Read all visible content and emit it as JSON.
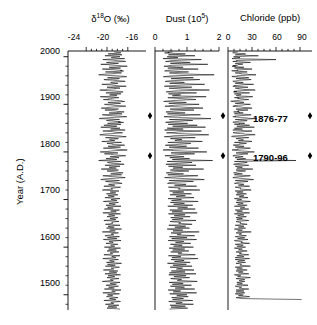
{
  "figure": {
    "yaxis": {
      "label": "Year (A.D.)",
      "ticks": [
        2000,
        1900,
        1800,
        1700,
        1600,
        1500
      ],
      "tick_labels": [
        "2000",
        "1900",
        "1800",
        "1700",
        "1600",
        "1500"
      ],
      "range": [
        1468,
        2012
      ],
      "minor_tick_interval": 20
    },
    "annotations": [
      {
        "name": "event-1876",
        "label": "1876-77",
        "year": 1876
      },
      {
        "name": "event-1790",
        "label": "1790-96",
        "year": 1792
      }
    ],
    "marker_color": "#000000",
    "line_color": "#000000"
  },
  "chart_data": [
    {
      "type": "line",
      "name": "d18o",
      "title": "δ",
      "title_sup": "18",
      "title_rest": "O (‰)",
      "title_plain": "δ18O (‰)",
      "xlabel": "δ18O (‰)",
      "ylabel": "Year (A.D.)",
      "xlim": [
        -27.5,
        -12.5
      ],
      "xticks": [
        -24,
        -20,
        -16
      ],
      "xtick_labels": [
        "-24",
        "-20",
        "-16"
      ],
      "ylim": [
        1468,
        2012
      ],
      "grid": false,
      "orientation": "vertical-time",
      "x": [
        2010,
        2008,
        2006,
        2004,
        2002,
        2000,
        1998,
        1996,
        1994,
        1992,
        1990,
        1988,
        1986,
        1984,
        1982,
        1980,
        1978,
        1976,
        1974,
        1972,
        1970,
        1968,
        1966,
        1964,
        1962,
        1960,
        1958,
        1956,
        1954,
        1952,
        1950,
        1948,
        1946,
        1944,
        1942,
        1940,
        1938,
        1936,
        1934,
        1932,
        1930,
        1928,
        1926,
        1924,
        1922,
        1920,
        1918,
        1916,
        1914,
        1912,
        1910,
        1908,
        1906,
        1904,
        1902,
        1900,
        1898,
        1896,
        1894,
        1892,
        1890,
        1888,
        1886,
        1884,
        1882,
        1880,
        1878,
        1876,
        1874,
        1872,
        1870,
        1868,
        1866,
        1864,
        1862,
        1860,
        1858,
        1856,
        1854,
        1852,
        1850,
        1848,
        1846,
        1844,
        1842,
        1840,
        1838,
        1836,
        1834,
        1832,
        1830,
        1828,
        1826,
        1824,
        1822,
        1820,
        1818,
        1816,
        1814,
        1812,
        1810,
        1808,
        1806,
        1804,
        1802,
        1800,
        1798,
        1796,
        1794,
        1792,
        1790,
        1788,
        1786,
        1784,
        1782,
        1780,
        1778,
        1776,
        1774,
        1772,
        1770,
        1768,
        1766,
        1764,
        1762,
        1760,
        1758,
        1756,
        1754,
        1752,
        1750,
        1748,
        1746,
        1744,
        1742,
        1740,
        1738,
        1736,
        1734,
        1732,
        1730,
        1728,
        1726,
        1724,
        1722,
        1720,
        1718,
        1716,
        1714,
        1712,
        1710,
        1708,
        1706,
        1704,
        1702,
        1700,
        1698,
        1696,
        1694,
        1692,
        1690,
        1688,
        1686,
        1684,
        1682,
        1680,
        1678,
        1676,
        1674,
        1672,
        1670,
        1668,
        1666,
        1664,
        1662,
        1660,
        1658,
        1656,
        1654,
        1652,
        1650,
        1648,
        1646,
        1644,
        1642,
        1640,
        1638,
        1636,
        1634,
        1632,
        1630,
        1628,
        1626,
        1624,
        1622,
        1620,
        1618,
        1616,
        1614,
        1612,
        1610,
        1608,
        1606,
        1604,
        1602,
        1600,
        1598,
        1596,
        1594,
        1592,
        1590,
        1588,
        1586,
        1584,
        1582,
        1580,
        1578,
        1576,
        1574,
        1572,
        1570,
        1568,
        1566,
        1564,
        1562,
        1560,
        1558,
        1556,
        1554,
        1552,
        1550,
        1548,
        1546,
        1544,
        1542,
        1540,
        1538,
        1536,
        1534,
        1532,
        1530,
        1528,
        1526,
        1524,
        1522,
        1520,
        1518,
        1516,
        1514,
        1512,
        1510,
        1508,
        1506,
        1504,
        1502,
        1500,
        1498,
        1496,
        1494,
        1492,
        1490,
        1488,
        1486,
        1484,
        1482,
        1480,
        1478,
        1476,
        1474,
        1472,
        1470
      ],
      "values": [
        -18.6,
        -17.3,
        -19.8,
        -17.1,
        -20.4,
        -17.5,
        -19.2,
        -16.6,
        -20.8,
        -18.2,
        -16.4,
        -20.1,
        -17.8,
        -21.2,
        -18.4,
        -16.1,
        -19.6,
        -17.4,
        -20.9,
        -18.1,
        -16.8,
        -20.3,
        -17.2,
        -19.4,
        -21.6,
        -18.3,
        -16.2,
        -19.9,
        -17.6,
        -20.6,
        -18.0,
        -16.5,
        -19.3,
        -17.9,
        -21.0,
        -18.7,
        -16.3,
        -20.0,
        -17.5,
        -19.7,
        -21.4,
        -18.5,
        -16.9,
        -20.2,
        -17.3,
        -19.5,
        -18.1,
        -21.3,
        -17.7,
        -19.1,
        -20.7,
        -18.2,
        -16.6,
        -19.8,
        -17.4,
        -20.5,
        -18.6,
        -16.4,
        -19.2,
        -21.1,
        -17.8,
        -20.4,
        -18.3,
        -16.7,
        -19.6,
        -17.1,
        -20.9,
        -18.8,
        -16.2,
        -19.4,
        -21.5,
        -17.6,
        -20.1,
        -18.4,
        -16.8,
        -19.9,
        -17.3,
        -20.6,
        -18.1,
        -21.2,
        -17.5,
        -19.3,
        -16.5,
        -20.8,
        -18.7,
        -17.0,
        -19.7,
        -21.4,
        -18.2,
        -16.3,
        -20.3,
        -17.8,
        -19.5,
        -18.5,
        -21.0,
        -17.2,
        -20.0,
        -18.9,
        -16.6,
        -19.8,
        -17.4,
        -20.7,
        -18.3,
        -16.1,
        -19.2,
        -21.3,
        -17.9,
        -20.5,
        -18.6,
        -16.4,
        -19.4,
        -17.7,
        -20.2,
        -18.1,
        -21.6,
        -17.3,
        -19.9,
        -18.8,
        -16.7,
        -20.4,
        -17.5,
        -19.6,
        -18.2,
        -21.1,
        -17.8,
        -20.0,
        -18.4,
        -16.9,
        -19.3,
        -17.2,
        -20.8,
        -18.7,
        -16.5,
        -19.5,
        -21.2,
        -17.6,
        -20.3,
        -18.0,
        -17.1,
        -19.7,
        -18.5,
        -20.6,
        -17.4,
        -19.1,
        -18.9,
        -20.9,
        -17.7,
        -19.4,
        -18.3,
        -20.1,
        -17.9,
        -19.8,
        -18.6,
        -20.4,
        -17.5,
        -19.2,
        -18.1,
        -20.7,
        -17.8,
        -19.6,
        -18.4,
        -20.2,
        -17.3,
        -19.9,
        -18.8,
        -20.5,
        -17.6,
        -19.3,
        -18.2,
        -20.8,
        -17.4,
        -19.7,
        -18.5,
        -20.0,
        -17.9,
        -19.4,
        -18.3,
        -20.6,
        -17.7,
        -19.1,
        -18.9,
        -20.3,
        -17.5,
        -19.8,
        -18.6,
        -20.1,
        -17.2,
        -19.5,
        -18.4,
        -20.9,
        -17.8,
        -19.2,
        -18.7,
        -20.4,
        -17.6,
        -19.9,
        -18.1,
        -20.7,
        -17.3,
        -19.6,
        -18.8,
        -20.2,
        -17.9,
        -19.3,
        -18.5,
        -20.5,
        -17.4,
        -19.7,
        -18.2,
        -20.0,
        -17.7,
        -19.4,
        -18.9,
        -20.6,
        -17.5,
        -19.1,
        -18.3,
        -20.8,
        -17.8,
        -19.5,
        -18.6,
        -20.1,
        -17.2,
        -19.9,
        -18.4,
        -20.3,
        -17.6,
        -19.2,
        -18.7,
        -20.7,
        -17.9,
        -19.6,
        -18.1,
        -20.4,
        -17.4,
        -19.8,
        -18.5,
        -20.0,
        -17.7,
        -19.3,
        -18.8,
        -20.9,
        -17.5,
        -19.4,
        -18.2,
        -20.2,
        -17.8,
        -19.7,
        -18.6,
        -20.5,
        -17.3,
        -19.1,
        -18.4,
        -20.8,
        -17.6,
        -19.9,
        -18.9,
        -20.1,
        -17.9,
        -19.5,
        -18.3,
        -20.6,
        -17.4,
        -19.2,
        -18.7,
        -20.3,
        -17.7,
        -19.8,
        -18.1,
        -20.0,
        -17.5,
        -19.6,
        -18.5,
        -20.7,
        -17.8,
        -19.3
      ]
    },
    {
      "type": "line",
      "name": "dust",
      "title": "Dust (10",
      "title_sup": "5",
      "title_rest": ")",
      "title_plain": "Dust (10^5)",
      "xlabel": "Dust (10^5)",
      "xlim": [
        0,
        2
      ],
      "xticks": [
        0,
        1,
        2
      ],
      "xtick_labels": [
        "0",
        "1",
        "2"
      ],
      "ylim": [
        1468,
        2012
      ],
      "grid": false,
      "orientation": "vertical-time",
      "values": [
        0.55,
        0.3,
        0.95,
        0.42,
        1.25,
        0.38,
        0.72,
        0.25,
        1.45,
        0.6,
        0.33,
        1.1,
        0.48,
        1.65,
        0.55,
        0.28,
        0.88,
        0.4,
        1.35,
        0.52,
        0.3,
        1.05,
        0.45,
        0.78,
        1.85,
        0.58,
        0.26,
        1.2,
        0.5,
        1.4,
        0.62,
        0.32,
        0.92,
        0.46,
        1.55,
        0.68,
        0.29,
        1.15,
        0.44,
        0.85,
        1.7,
        0.6,
        0.35,
        1.3,
        0.42,
        0.8,
        0.54,
        1.6,
        0.4,
        0.75,
        1.28,
        0.56,
        0.27,
        0.98,
        0.43,
        1.38,
        0.64,
        0.31,
        0.9,
        1.5,
        0.47,
        1.22,
        0.58,
        0.34,
        0.94,
        0.39,
        1.42,
        0.7,
        0.28,
        0.86,
        1.75,
        0.45,
        1.18,
        0.6,
        0.33,
        1.02,
        0.41,
        1.32,
        0.55,
        1.58,
        0.38,
        0.88,
        0.3,
        1.45,
        0.72,
        0.36,
        0.96,
        1.68,
        0.58,
        0.29,
        1.26,
        0.48,
        0.84,
        0.62,
        1.48,
        0.4,
        1.12,
        0.74,
        0.32,
        0.99,
        0.44,
        1.36,
        0.6,
        0.25,
        0.82,
        1.62,
        0.5,
        1.24,
        0.68,
        0.31,
        0.91,
        0.46,
        1.08,
        0.54,
        1.8,
        0.38,
        1.16,
        0.76,
        0.34,
        1.28,
        0.42,
        0.87,
        0.56,
        1.52,
        0.48,
        1.06,
        0.58,
        0.35,
        0.89,
        0.4,
        1.34,
        0.7,
        0.3,
        0.93,
        1.54,
        0.44,
        1.2,
        0.52,
        0.39,
        0.97,
        0.61,
        1.3,
        0.42,
        0.79,
        0.73,
        1.4,
        0.45,
        0.9,
        0.55,
        1.14,
        0.47,
        0.95,
        0.66,
        1.22,
        0.41,
        0.83,
        0.52,
        1.35,
        0.48,
        0.92,
        0.58,
        1.18,
        0.4,
        1.02,
        0.71,
        1.26,
        0.46,
        0.86,
        0.53,
        1.32,
        0.42,
        0.94,
        0.6,
        1.1,
        0.49,
        0.88,
        0.54,
        1.28,
        0.47,
        0.8,
        0.74,
        1.16,
        0.43,
        0.96,
        0.62,
        1.08,
        0.38,
        0.87,
        0.56,
        1.38,
        0.5,
        0.82,
        0.69,
        1.24,
        0.45,
        1.0,
        0.52,
        1.3,
        0.41,
        0.9,
        0.64,
        1.12,
        0.48,
        0.85,
        0.58,
        1.2,
        0.44,
        0.93,
        0.55,
        1.06,
        0.49,
        0.84,
        0.72,
        1.26,
        0.42,
        0.81,
        0.53,
        1.34,
        0.5,
        0.91,
        0.61,
        1.1,
        0.39,
        0.98,
        0.56,
        1.16,
        0.47,
        0.86,
        0.67,
        1.22,
        0.51,
        0.94,
        0.45,
        1.28,
        0.43,
        0.97,
        0.59,
        1.08,
        0.49,
        0.83,
        0.7,
        1.32,
        0.44,
        0.88,
        0.54,
        1.14,
        0.48,
        0.92,
        0.63,
        1.24,
        0.41,
        0.8,
        0.57,
        1.3,
        0.46,
        1.0,
        0.68,
        1.04,
        0.52,
        0.89,
        0.55,
        1.18,
        0.43,
        0.85,
        0.65,
        1.2,
        0.47,
        0.95,
        0.5,
        1.02,
        0.45,
        0.9,
        0.6,
        1.26,
        0.48,
        0.87
      ]
    },
    {
      "type": "line",
      "name": "chloride",
      "title": "Chloride (ppb)",
      "title_sup": "",
      "title_rest": "",
      "title_plain": "Chloride (ppb)",
      "xlabel": "Chloride (ppb)",
      "xlim": [
        0,
        105
      ],
      "xticks": [
        0,
        30,
        60,
        90
      ],
      "xtick_labels": [
        "0",
        "30",
        "60",
        "90"
      ],
      "ylim": [
        1468,
        2012
      ],
      "grid": false,
      "orientation": "vertical-time",
      "values": [
        12,
        6,
        22,
        9,
        38,
        7,
        15,
        5,
        60,
        11,
        6,
        28,
        10,
        18,
        12,
        5,
        20,
        8,
        30,
        11,
        6,
        24,
        9,
        16,
        35,
        12,
        5,
        26,
        10,
        29,
        13,
        7,
        19,
        9,
        32,
        14,
        6,
        25,
        9,
        17,
        34,
        12,
        7,
        27,
        8,
        16,
        11,
        31,
        8,
        15,
        26,
        11,
        5,
        20,
        9,
        28,
        13,
        6,
        18,
        30,
        10,
        25,
        12,
        7,
        19,
        8,
        29,
        14,
        6,
        17,
        36,
        9,
        24,
        12,
        7,
        21,
        8,
        27,
        11,
        33,
        8,
        18,
        6,
        30,
        15,
        7,
        20,
        34,
        12,
        6,
        26,
        10,
        17,
        13,
        30,
        8,
        23,
        15,
        7,
        20,
        9,
        28,
        12,
        5,
        17,
        33,
        10,
        25,
        14,
        6,
        19,
        9,
        22,
        11,
        85,
        8,
        24,
        15,
        7,
        26,
        9,
        18,
        11,
        31,
        10,
        22,
        12,
        7,
        18,
        8,
        28,
        14,
        6,
        19,
        32,
        9,
        25,
        11,
        8,
        20,
        13,
        27,
        9,
        16,
        15,
        29,
        9,
        19,
        11,
        23,
        10,
        20,
        14,
        25,
        8,
        17,
        11,
        28,
        10,
        19,
        12,
        24,
        8,
        21,
        15,
        26,
        9,
        18,
        11,
        27,
        8,
        20,
        12,
        23,
        10,
        18,
        11,
        26,
        10,
        16,
        15,
        24,
        9,
        20,
        13,
        22,
        8,
        18,
        12,
        29,
        10,
        17,
        14,
        23,
        9,
        21,
        12,
        25,
        8,
        16,
        16,
        27,
        9,
        19,
        11,
        22,
        8,
        18,
        13,
        24,
        10,
        17,
        14,
        26,
        11,
        20,
        9,
        27,
        9,
        21,
        12,
        22,
        10,
        17,
        15,
        28,
        9,
        18,
        11,
        24,
        10,
        19,
        13,
        26,
        8,
        16,
        12,
        28,
        10,
        21,
        14,
        21,
        11,
        18,
        11,
        25,
        9,
        17,
        14,
        26,
        10,
        20,
        10,
        21,
        9,
        19,
        13,
        27,
        10,
        18,
        92
      ]
    }
  ]
}
